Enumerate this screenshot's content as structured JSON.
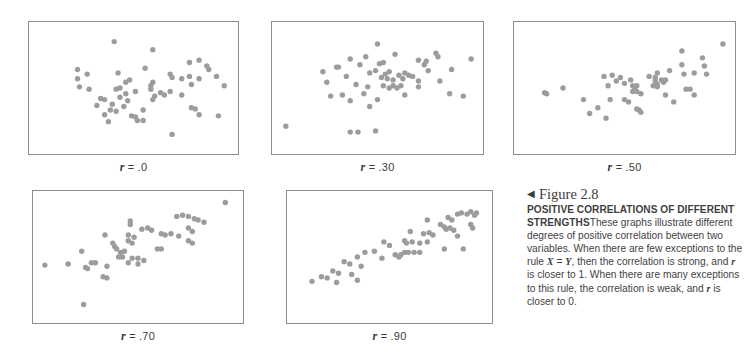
{
  "figure": {
    "arrow_glyph": "◀",
    "figure_number": "Figure 2.8",
    "headline": "POSITIVE CORRELATIONS OF DIFFERENT STRENGTHS",
    "body_part_1": "These graphs illustrate different degrees of positive correlation between two variables. When there are few exceptions to the rule ",
    "rule_x": "X",
    "rule_eq": " = ",
    "rule_y": "Y",
    "body_part_2": ", then the correlation is strong, and ",
    "r_symbol_1": "r",
    "body_part_3": " is closer to 1. When there are many exceptions to this rule, the correlation is weak, and ",
    "r_symbol_2": "r",
    "body_part_4": " is closer to 0."
  },
  "style": {
    "dot_color": "#9c9c9c",
    "frame_color": "#8c8c94",
    "background": "#ffffff",
    "text_color": "#3f3f3f"
  },
  "chart_data": [
    {
      "type": "scatter",
      "title": "r = .0",
      "r_prefix": "r",
      "r_value": "= .0",
      "correlation": 0.0,
      "xlabel": "",
      "ylabel": "",
      "xlim": [
        0,
        1
      ],
      "ylim": [
        0,
        1
      ],
      "grid": false,
      "legend": false,
      "n_points": 57,
      "points": [
        [
          0.4,
          0.9
        ],
        [
          0.6,
          0.83
        ],
        [
          0.79,
          0.72
        ],
        [
          0.84,
          0.74
        ],
        [
          0.21,
          0.66
        ],
        [
          0.56,
          0.67
        ],
        [
          0.88,
          0.69
        ],
        [
          0.89,
          0.66
        ],
        [
          0.69,
          0.62
        ],
        [
          0.21,
          0.58
        ],
        [
          0.42,
          0.63
        ],
        [
          0.79,
          0.6
        ],
        [
          0.84,
          0.58
        ],
        [
          0.93,
          0.6
        ],
        [
          0.46,
          0.55
        ],
        [
          0.48,
          0.57
        ],
        [
          0.6,
          0.55
        ],
        [
          0.7,
          0.59
        ],
        [
          0.75,
          0.58
        ],
        [
          0.22,
          0.51
        ],
        [
          0.41,
          0.49
        ],
        [
          0.43,
          0.5
        ],
        [
          0.8,
          0.53
        ],
        [
          0.97,
          0.52
        ],
        [
          0.46,
          0.45
        ],
        [
          0.51,
          0.47
        ],
        [
          0.64,
          0.46
        ],
        [
          0.66,
          0.44
        ],
        [
          0.69,
          0.47
        ],
        [
          0.75,
          0.44
        ],
        [
          0.33,
          0.41
        ],
        [
          0.35,
          0.4
        ],
        [
          0.43,
          0.42
        ],
        [
          0.47,
          0.39
        ],
        [
          0.61,
          0.43
        ],
        [
          0.6,
          0.4
        ],
        [
          0.31,
          0.35
        ],
        [
          0.39,
          0.36
        ],
        [
          0.45,
          0.34
        ],
        [
          0.38,
          0.31
        ],
        [
          0.55,
          0.31
        ],
        [
          0.8,
          0.33
        ],
        [
          0.82,
          0.32
        ],
        [
          0.35,
          0.27
        ],
        [
          0.49,
          0.26
        ],
        [
          0.51,
          0.25
        ],
        [
          0.84,
          0.27
        ],
        [
          0.94,
          0.26
        ],
        [
          0.37,
          0.21
        ],
        [
          0.52,
          0.22
        ],
        [
          0.55,
          0.22
        ],
        [
          0.7,
          0.1
        ],
        [
          0.26,
          0.62
        ],
        [
          0.27,
          0.49
        ],
        [
          0.59,
          0.52
        ],
        [
          0.59,
          0.49
        ],
        [
          0.41,
          0.3
        ]
      ]
    },
    {
      "type": "scatter",
      "title": "r = .30",
      "r_prefix": "r",
      "r_value": "= .30",
      "correlation": 0.3,
      "xlabel": "",
      "ylabel": "",
      "xlim": [
        0,
        1
      ],
      "ylim": [
        0,
        1
      ],
      "grid": false,
      "legend": false,
      "n_points": 55,
      "points": [
        [
          0.5,
          0.88
        ],
        [
          0.36,
          0.75
        ],
        [
          0.44,
          0.77
        ],
        [
          0.59,
          0.79
        ],
        [
          0.8,
          0.8
        ],
        [
          0.81,
          0.77
        ],
        [
          0.98,
          0.75
        ],
        [
          0.29,
          0.68
        ],
        [
          0.3,
          0.68
        ],
        [
          0.41,
          0.7
        ],
        [
          0.51,
          0.71
        ],
        [
          0.53,
          0.72
        ],
        [
          0.71,
          0.74
        ],
        [
          0.74,
          0.7
        ],
        [
          0.75,
          0.73
        ],
        [
          0.22,
          0.64
        ],
        [
          0.46,
          0.63
        ],
        [
          0.49,
          0.65
        ],
        [
          0.54,
          0.62
        ],
        [
          0.56,
          0.64
        ],
        [
          0.61,
          0.61
        ],
        [
          0.64,
          0.63
        ],
        [
          0.66,
          0.61
        ],
        [
          0.76,
          0.65
        ],
        [
          0.88,
          0.66
        ],
        [
          0.52,
          0.59
        ],
        [
          0.55,
          0.58
        ],
        [
          0.58,
          0.57
        ],
        [
          0.63,
          0.58
        ],
        [
          0.71,
          0.56
        ],
        [
          0.39,
          0.53
        ],
        [
          0.45,
          0.51
        ],
        [
          0.53,
          0.52
        ],
        [
          0.56,
          0.5
        ],
        [
          0.58,
          0.52
        ],
        [
          0.6,
          0.5
        ],
        [
          0.62,
          0.52
        ],
        [
          0.71,
          0.51
        ],
        [
          0.26,
          0.43
        ],
        [
          0.32,
          0.44
        ],
        [
          0.43,
          0.45
        ],
        [
          0.64,
          0.44
        ],
        [
          0.87,
          0.45
        ],
        [
          0.94,
          0.43
        ],
        [
          0.36,
          0.39
        ],
        [
          0.5,
          0.4
        ],
        [
          0.46,
          0.34
        ],
        [
          0.03,
          0.17
        ],
        [
          0.36,
          0.12
        ],
        [
          0.4,
          0.12
        ],
        [
          0.49,
          0.13
        ],
        [
          0.24,
          0.55
        ],
        [
          0.68,
          0.6
        ],
        [
          0.82,
          0.56
        ],
        [
          0.34,
          0.6
        ]
      ]
    },
    {
      "type": "scatter",
      "title": "r = .50",
      "r_prefix": "r",
      "r_value": "= .50",
      "correlation": 0.5,
      "xlabel": "",
      "ylabel": "",
      "xlim": [
        0,
        1
      ],
      "ylim": [
        0,
        1
      ],
      "grid": false,
      "legend": false,
      "n_points": 50,
      "points": [
        [
          0.98,
          0.88
        ],
        [
          0.78,
          0.82
        ],
        [
          0.88,
          0.76
        ],
        [
          0.78,
          0.7
        ],
        [
          0.89,
          0.69
        ],
        [
          0.66,
          0.63
        ],
        [
          0.72,
          0.65
        ],
        [
          0.79,
          0.62
        ],
        [
          0.84,
          0.63
        ],
        [
          0.9,
          0.62
        ],
        [
          0.4,
          0.6
        ],
        [
          0.44,
          0.61
        ],
        [
          0.48,
          0.59
        ],
        [
          0.62,
          0.6
        ],
        [
          0.65,
          0.59
        ],
        [
          0.53,
          0.57
        ],
        [
          0.65,
          0.56
        ],
        [
          0.68,
          0.57
        ],
        [
          0.69,
          0.55
        ],
        [
          0.7,
          0.57
        ],
        [
          0.42,
          0.52
        ],
        [
          0.5,
          0.54
        ],
        [
          0.54,
          0.52
        ],
        [
          0.55,
          0.5
        ],
        [
          0.56,
          0.52
        ],
        [
          0.66,
          0.51
        ],
        [
          0.8,
          0.49
        ],
        [
          0.82,
          0.49
        ],
        [
          0.11,
          0.46
        ],
        [
          0.12,
          0.45
        ],
        [
          0.2,
          0.5
        ],
        [
          0.54,
          0.47
        ],
        [
          0.56,
          0.47
        ],
        [
          0.58,
          0.45
        ],
        [
          0.7,
          0.44
        ],
        [
          0.84,
          0.44
        ],
        [
          0.3,
          0.4
        ],
        [
          0.43,
          0.4
        ],
        [
          0.5,
          0.4
        ],
        [
          0.52,
          0.38
        ],
        [
          0.74,
          0.38
        ],
        [
          0.37,
          0.33
        ],
        [
          0.56,
          0.32
        ],
        [
          0.57,
          0.31
        ],
        [
          0.58,
          0.29
        ],
        [
          0.33,
          0.28
        ],
        [
          0.41,
          0.24
        ],
        [
          0.64,
          0.52
        ],
        [
          0.66,
          0.53
        ],
        [
          0.46,
          0.56
        ]
      ]
    },
    {
      "type": "scatter",
      "title": "r = .70",
      "r_prefix": "r",
      "r_value": "= .70",
      "correlation": 0.7,
      "xlabel": "",
      "ylabel": "",
      "xlim": [
        0,
        1
      ],
      "ylim": [
        0,
        1
      ],
      "grid": false,
      "legend": false,
      "n_points": 50,
      "points": [
        [
          0.95,
          0.97
        ],
        [
          0.7,
          0.85
        ],
        [
          0.73,
          0.86
        ],
        [
          0.76,
          0.85
        ],
        [
          0.79,
          0.83
        ],
        [
          0.81,
          0.82
        ],
        [
          0.84,
          0.8
        ],
        [
          0.46,
          0.81
        ],
        [
          0.46,
          0.78
        ],
        [
          0.52,
          0.74
        ],
        [
          0.55,
          0.75
        ],
        [
          0.57,
          0.73
        ],
        [
          0.76,
          0.75
        ],
        [
          0.78,
          0.72
        ],
        [
          0.33,
          0.69
        ],
        [
          0.45,
          0.69
        ],
        [
          0.48,
          0.67
        ],
        [
          0.62,
          0.7
        ],
        [
          0.64,
          0.69
        ],
        [
          0.67,
          0.7
        ],
        [
          0.71,
          0.68
        ],
        [
          0.45,
          0.64
        ],
        [
          0.47,
          0.62
        ],
        [
          0.76,
          0.64
        ],
        [
          0.78,
          0.62
        ],
        [
          0.38,
          0.59
        ],
        [
          0.39,
          0.57
        ],
        [
          0.41,
          0.54
        ],
        [
          0.43,
          0.55
        ],
        [
          0.6,
          0.57
        ],
        [
          0.62,
          0.57
        ],
        [
          0.21,
          0.55
        ],
        [
          0.4,
          0.5
        ],
        [
          0.42,
          0.5
        ],
        [
          0.47,
          0.49
        ],
        [
          0.5,
          0.49
        ],
        [
          0.53,
          0.47
        ],
        [
          0.26,
          0.45
        ],
        [
          0.28,
          0.45
        ],
        [
          0.14,
          0.44
        ],
        [
          0.23,
          0.41
        ],
        [
          0.24,
          0.4
        ],
        [
          0.34,
          0.42
        ],
        [
          0.45,
          0.45
        ],
        [
          0.5,
          0.44
        ],
        [
          0.02,
          0.43
        ],
        [
          0.32,
          0.33
        ],
        [
          0.34,
          0.32
        ],
        [
          0.22,
          0.09
        ],
        [
          0.37,
          0.62
        ]
      ]
    },
    {
      "type": "scatter",
      "title": "r = .90",
      "r_prefix": "r",
      "r_value": "= .90",
      "correlation": 0.9,
      "xlabel": "",
      "ylabel": "",
      "xlim": [
        0,
        1
      ],
      "ylim": [
        0,
        1
      ],
      "grid": false,
      "legend": false,
      "n_points": 52,
      "points": [
        [
          0.86,
          0.87
        ],
        [
          0.88,
          0.88
        ],
        [
          0.91,
          0.87
        ],
        [
          0.93,
          0.89
        ],
        [
          0.95,
          0.86
        ],
        [
          0.96,
          0.88
        ],
        [
          0.81,
          0.84
        ],
        [
          0.83,
          0.82
        ],
        [
          0.7,
          0.82
        ],
        [
          0.77,
          0.78
        ],
        [
          0.79,
          0.76
        ],
        [
          0.8,
          0.74
        ],
        [
          0.82,
          0.75
        ],
        [
          0.84,
          0.73
        ],
        [
          0.93,
          0.78
        ],
        [
          0.94,
          0.75
        ],
        [
          0.61,
          0.72
        ],
        [
          0.68,
          0.7
        ],
        [
          0.71,
          0.71
        ],
        [
          0.73,
          0.69
        ],
        [
          0.86,
          0.68
        ],
        [
          0.58,
          0.64
        ],
        [
          0.59,
          0.62
        ],
        [
          0.62,
          0.63
        ],
        [
          0.66,
          0.62
        ],
        [
          0.7,
          0.63
        ],
        [
          0.47,
          0.63
        ],
        [
          0.5,
          0.6
        ],
        [
          0.89,
          0.57
        ],
        [
          0.79,
          0.57
        ],
        [
          0.58,
          0.54
        ],
        [
          0.6,
          0.54
        ],
        [
          0.63,
          0.54
        ],
        [
          0.66,
          0.54
        ],
        [
          0.37,
          0.54
        ],
        [
          0.42,
          0.55
        ],
        [
          0.53,
          0.52
        ],
        [
          0.55,
          0.5
        ],
        [
          0.56,
          0.52
        ],
        [
          0.33,
          0.5
        ],
        [
          0.46,
          0.49
        ],
        [
          0.26,
          0.46
        ],
        [
          0.29,
          0.44
        ],
        [
          0.35,
          0.42
        ],
        [
          0.2,
          0.38
        ],
        [
          0.23,
          0.36
        ],
        [
          0.3,
          0.35
        ],
        [
          0.14,
          0.33
        ],
        [
          0.17,
          0.32
        ],
        [
          0.09,
          0.29
        ],
        [
          0.22,
          0.28
        ],
        [
          0.33,
          0.3
        ]
      ]
    }
  ]
}
